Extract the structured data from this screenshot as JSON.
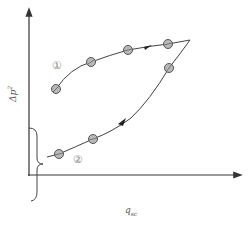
{
  "diagram": {
    "axes": {
      "y_label_base": "Δp",
      "y_label_sup": "2",
      "x_label_base": "q",
      "x_label_sub": "sc"
    },
    "curves": [
      {
        "id": "1",
        "label": "①",
        "direction": "increasing (toward apex)",
        "markers": [
          [
            56,
            89
          ],
          [
            91,
            62
          ],
          [
            128,
            50
          ],
          [
            168,
            44
          ]
        ]
      },
      {
        "id": "2",
        "label": "②",
        "direction": "decreasing (from apex back)",
        "markers": [
          [
            169,
            68
          ],
          [
            93,
            139
          ],
          [
            59,
            154
          ]
        ]
      }
    ],
    "brace": "intercept range on Δp² axis",
    "colors": {
      "axis": "#333333",
      "curve": "#444444",
      "marker_fill": "#b8b8b8",
      "marker_stroke": "#555555",
      "label": "#888888"
    }
  }
}
